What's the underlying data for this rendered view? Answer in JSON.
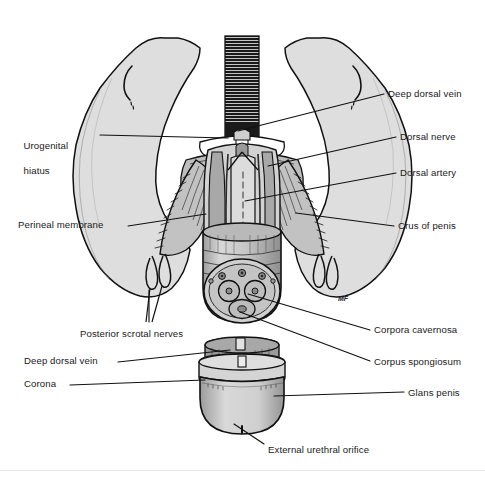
{
  "figure": {
    "domain": "anatomical illustration",
    "view": "inferior (lithotomy) view of male perineum with penis in longitudinal and cross section",
    "background_color": "#ffffff",
    "ink_color": "#1a1a1a",
    "artist_signature": "MF",
    "tones": {
      "skin_light": "#e0e0e0",
      "skin_mid": "#c9c9c9",
      "muscle_mid": "#b5b5b5",
      "muscle_dark": "#8f8f8f",
      "cavity_dark": "#5a5a5a",
      "outline": "#111111",
      "white": "#ffffff"
    }
  },
  "labels": {
    "left": [
      {
        "id": "urogenital-hiatus",
        "text": "Urogenital",
        "text2": "hiatus",
        "x": 18,
        "y": 128,
        "leader_from": [
          100,
          135
        ],
        "leader_to": [
          228,
          135
        ]
      },
      {
        "id": "perineal-membrane",
        "text": "Perineal membrane",
        "x": 18,
        "y": 220,
        "leader_from": [
          128,
          226
        ],
        "leader_to": [
          205,
          213
        ]
      },
      {
        "id": "posterior-scrotal-nerves",
        "text": "Posterior scrotal nerves",
        "x": 78,
        "y": 330,
        "leader_from": [
          150,
          326
        ],
        "leader_to": [
          150,
          282
        ]
      },
      {
        "id": "deep-dorsal-vein-lower",
        "text": "Deep dorsal vein",
        "x": 24,
        "y": 357,
        "leader_from": [
          118,
          362
        ],
        "leader_to": [
          228,
          352
        ]
      },
      {
        "id": "corona",
        "text": "Corona",
        "x": 24,
        "y": 380,
        "leader_from": [
          70,
          385
        ],
        "leader_to": [
          205,
          381
        ]
      }
    ],
    "right": [
      {
        "id": "deep-dorsal-vein-upper",
        "text": "Deep dorsal vein",
        "x": 388,
        "y": 90,
        "leader_from": [
          384,
          96
        ],
        "leader_to": [
          233,
          133
        ]
      },
      {
        "id": "dorsal-nerve",
        "text": "Dorsal nerve",
        "x": 400,
        "y": 133,
        "leader_from": [
          396,
          139
        ],
        "leader_to": [
          268,
          167
        ]
      },
      {
        "id": "dorsal-artery",
        "text": "Dorsal artery",
        "x": 400,
        "y": 169,
        "leader_from": [
          396,
          175
        ],
        "leader_to": [
          243,
          202
        ]
      },
      {
        "id": "crus-of-penis",
        "text": "Crus of penis",
        "x": 398,
        "y": 222,
        "leader_from": [
          394,
          228
        ],
        "leader_to": [
          287,
          216
        ]
      },
      {
        "id": "corpora-cavernosa",
        "text": "Corpora cavernosa",
        "x": 374,
        "y": 327,
        "leader_from": [
          370,
          332
        ],
        "leader_to": [
          246,
          300
        ]
      },
      {
        "id": "corpus-spongiosum",
        "text": "Corpus spongiosum",
        "x": 374,
        "y": 359,
        "leader_from": [
          370,
          363
        ],
        "leader_to": [
          238,
          320
        ]
      },
      {
        "id": "glans-penis",
        "text": "Glans penis",
        "x": 408,
        "y": 389,
        "leader_from": [
          404,
          394
        ],
        "leader_to": [
          272,
          394
        ]
      }
    ],
    "bottom": [
      {
        "id": "external-urethral-orifice",
        "text": "External urethral orifice",
        "x": 268,
        "y": 446,
        "leader_from": [
          264,
          444
        ],
        "leader_to": [
          232,
          422
        ]
      }
    ]
  }
}
